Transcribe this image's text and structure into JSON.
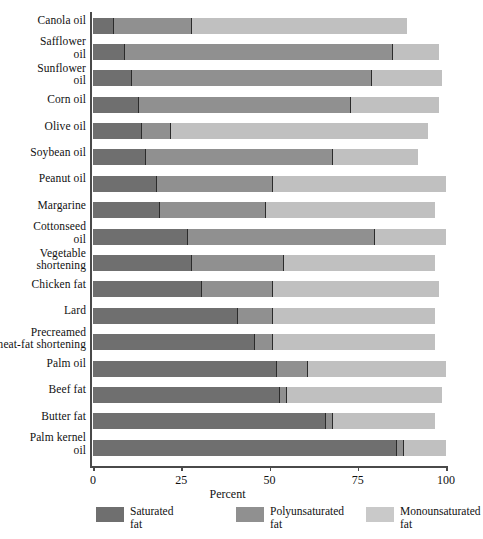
{
  "chart_data": {
    "type": "bar",
    "subtype": "horizontal-stacked-bar",
    "title": "",
    "xlabel": "Percent",
    "ylabel": "",
    "xlim": [
      0,
      100
    ],
    "xticks": [
      0,
      25,
      50,
      75,
      100
    ],
    "xtick_labels": [
      "0",
      "25",
      "50",
      "75",
      "100"
    ],
    "grid": false,
    "legend_position": "bottom",
    "categories": [
      "Canola oil",
      "Safflower oil",
      "Sunflower oil",
      "Corn oil",
      "Olive oil",
      "Soybean oil",
      "Peanut oil",
      "Margarine",
      "Cottonseed oil",
      "Vegetable shortening",
      "Chicken fat",
      "Lard",
      "Precreamed meat-fat shortening",
      "Palm oil",
      "Beef fat",
      "Butter fat",
      "Palm kernel oil"
    ],
    "series": [
      {
        "name": "Saturated fat",
        "color": "#6f6f6f",
        "values": [
          6,
          9,
          11,
          13,
          14,
          15,
          18,
          19,
          27,
          28,
          31,
          41,
          46,
          52,
          53,
          66,
          86
        ]
      },
      {
        "name": "Polyunsaturated fat",
        "color": "#909090",
        "values": [
          22,
          76,
          68,
          60,
          8,
          53,
          33,
          30,
          53,
          26,
          20,
          10,
          5,
          9,
          2,
          2,
          2
        ]
      },
      {
        "name": "Monounsaturated fat",
        "color": "#c0c0c0",
        "values": [
          61,
          13,
          20,
          25,
          73,
          24,
          49,
          48,
          20,
          43,
          47,
          46,
          46,
          39,
          44,
          29,
          12
        ]
      }
    ],
    "legend": [
      {
        "label_line1": "Saturated",
        "label_line2": "fat",
        "color": "#6f6f6f",
        "swatch": "sat"
      },
      {
        "label_line1": "Polyunsaturated",
        "label_line2": "fat",
        "color": "#909090",
        "swatch": "poly"
      },
      {
        "label_line1": "Monounsaturated",
        "label_line2": "fat",
        "color": "#c9c9c9",
        "swatch": "mono"
      }
    ],
    "category_label_lines": [
      [
        "Canola oil"
      ],
      [
        "Safflower",
        "oil"
      ],
      [
        "Sunflower",
        "oil"
      ],
      [
        "Corn oil"
      ],
      [
        "Olive oil"
      ],
      [
        "Soybean oil"
      ],
      [
        "Peanut oil"
      ],
      [
        "Margarine"
      ],
      [
        "Cottonseed",
        "oil"
      ],
      [
        "Vegetable",
        "shortening"
      ],
      [
        "Chicken fat"
      ],
      [
        "Lard"
      ],
      [
        "Precreamed",
        "meat-fat shortening"
      ],
      [
        "Palm oil"
      ],
      [
        "Beef fat"
      ],
      [
        "Butter fat"
      ],
      [
        "Palm kernel",
        "oil"
      ]
    ]
  }
}
